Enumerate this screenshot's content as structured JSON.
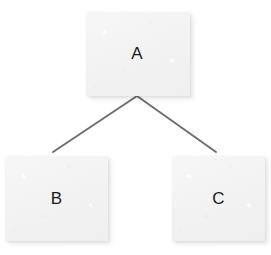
{
  "diagram": {
    "type": "tree",
    "title": "",
    "canvas": {
      "width": 271,
      "height": 255,
      "background_color": "#ffffff"
    },
    "style": {
      "node_fill_color": "#f4f4f4",
      "node_label_color": "#1c1c1c",
      "edge_color": "#6e6e6e",
      "edge_width": 2
    },
    "nodes": [
      {
        "id": "a",
        "label": "A",
        "role": "root",
        "x": 86,
        "y": 12,
        "width": 104,
        "height": 84
      },
      {
        "id": "b",
        "label": "B",
        "role": "child",
        "x": 5,
        "y": 156,
        "width": 103,
        "height": 85
      },
      {
        "id": "c",
        "label": "C",
        "role": "child",
        "x": 172,
        "y": 156,
        "width": 93,
        "height": 85
      }
    ],
    "edges": [
      {
        "id": "a-b",
        "from": "A",
        "to": "B",
        "x1": 137,
        "y1": 96,
        "x2": 53,
        "y2": 152
      },
      {
        "id": "a-c",
        "from": "A",
        "to": "C",
        "x1": 137,
        "y1": 96,
        "x2": 216,
        "y2": 152
      }
    ]
  }
}
